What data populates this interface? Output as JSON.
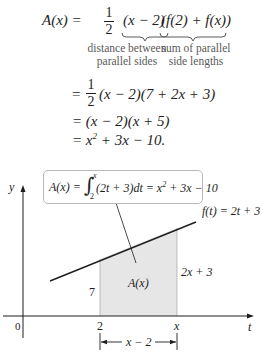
{
  "derivation": {
    "line1": {
      "lhs": "A(x) =",
      "frac_num": "1",
      "frac_den": "2",
      "term1": "(x − 2)",
      "term2": "(f(2) + f(x))",
      "note1_line1": "distance between",
      "note1_line2": "parallel sides",
      "note2_line1": "sum of parallel",
      "note2_line2": "side lengths"
    },
    "line2": {
      "eq": "=",
      "frac_num": "1",
      "frac_den": "2",
      "rest": "(x − 2)(7 + 2x + 3)"
    },
    "line3": {
      "text": "= (x − 2)(x + 5)"
    },
    "line4": {
      "prefix": "= x",
      "sup": "2",
      "suffix": " + 3x − 10."
    }
  },
  "figure": {
    "callout": {
      "lhs": "A(x) =",
      "upper": "x",
      "lower": "2",
      "integrand": "(2t + 3)dt = x",
      "sup": "2",
      "rhs": " + 3x − 10"
    },
    "y_axis_label": "y",
    "t_axis_label": "t",
    "origin_label": "0",
    "tick_2_label": "2",
    "tick_x_label": "x",
    "line_label": "f(t) = 2t + 3",
    "left_height_label": "7",
    "right_height_label": "2x + 3",
    "area_label": "A(x)",
    "width_label": "x − 2",
    "colors": {
      "shade": "#e6e6e6",
      "ink": "#1e1e1e",
      "callout_border": "#b9b9b9",
      "note": "#5a5a5a"
    }
  }
}
